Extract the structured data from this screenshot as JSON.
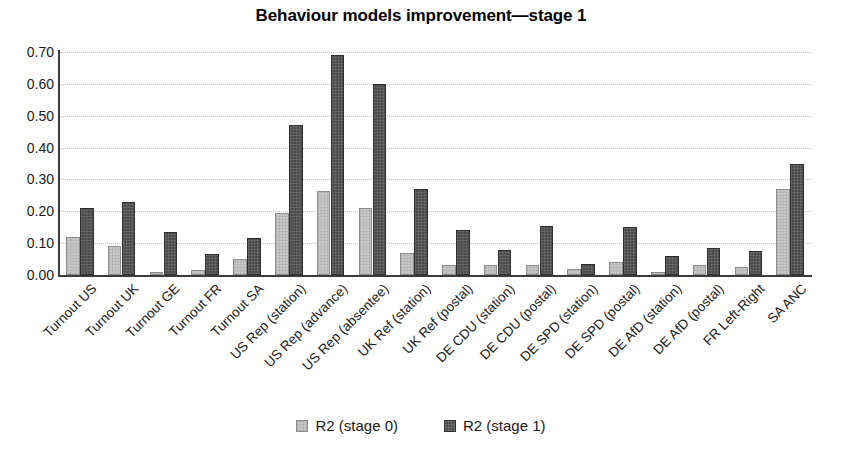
{
  "chart_data": {
    "type": "bar",
    "title": "Behaviour models improvement—stage 1",
    "xlabel": "",
    "ylabel": "",
    "ylim": [
      0.0,
      0.7
    ],
    "ytick_labels": [
      "0.00",
      "0.10",
      "0.20",
      "0.30",
      "0.40",
      "0.50",
      "0.60",
      "0.70"
    ],
    "ytick_values": [
      0.0,
      0.1,
      0.2,
      0.3,
      0.4,
      0.5,
      0.6,
      0.7
    ],
    "grid": "horizontal-dotted",
    "legend_position": "bottom-center",
    "categories": [
      "Turnout US",
      "Turnout UK",
      "Turnout GE",
      "Turnout FR",
      "Turnout SA",
      "US Rep (station)",
      "US Rep (advance)",
      "US Rep (absentee)",
      "UK Ref (station)",
      "UK Ref (postal)",
      "DE CDU (station)",
      "DE CDU (postal)",
      "DE SPD (station)",
      "DE SPD (postal)",
      "DE AfD (station)",
      "DE AfD (postal)",
      "FR Left-Right",
      "SA ANC"
    ],
    "series": [
      {
        "name": "R2 (stage 0)",
        "color": "#c6c6c6",
        "values": [
          0.12,
          0.09,
          0.01,
          0.015,
          0.05,
          0.195,
          0.265,
          0.21,
          0.07,
          0.03,
          0.03,
          0.03,
          0.02,
          0.04,
          0.01,
          0.03,
          0.025,
          0.27
        ]
      },
      {
        "name": "R2 (stage 1)",
        "color": "#4b4b4b",
        "values": [
          0.21,
          0.23,
          0.135,
          0.065,
          0.115,
          0.47,
          0.69,
          0.6,
          0.27,
          0.14,
          0.08,
          0.155,
          0.035,
          0.15,
          0.06,
          0.085,
          0.075,
          0.35
        ]
      }
    ]
  }
}
